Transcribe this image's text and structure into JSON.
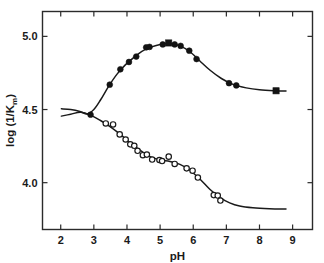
{
  "chart_data": {
    "type": "scatter",
    "title": "",
    "xlabel": "pH",
    "ylabel": "log (1/K",
    "ylabel_sub": "m",
    "ylabel_tail": ")",
    "xlim": [
      1.45,
      9.6
    ],
    "ylim": [
      3.68,
      5.17
    ],
    "xticks": [
      2,
      3,
      4,
      5,
      6,
      7,
      8,
      9
    ],
    "xticklabels": [
      "2",
      "3",
      "4",
      "5",
      "6",
      "7",
      "8",
      "9"
    ],
    "yticks": [
      4.0,
      4.5,
      5.0
    ],
    "yticklabels": [
      "4.0",
      "4.5",
      "5.0"
    ],
    "grid": false,
    "legend": "none",
    "frame": "box",
    "ticks_inside": true,
    "series": [
      {
        "name": "upper-branch-filled",
        "marker": "filled-circle",
        "points": [
          {
            "x": 2.9,
            "y": 4.465
          },
          {
            "x": 3.48,
            "y": 4.67
          },
          {
            "x": 3.8,
            "y": 4.775
          },
          {
            "x": 4.06,
            "y": 4.825
          },
          {
            "x": 4.28,
            "y": 4.862
          },
          {
            "x": 4.58,
            "y": 4.925
          },
          {
            "x": 4.68,
            "y": 4.928
          },
          {
            "x": 5.08,
            "y": 4.945
          },
          {
            "x": 5.44,
            "y": 4.945
          },
          {
            "x": 5.62,
            "y": 4.935
          },
          {
            "x": 5.88,
            "y": 4.902
          },
          {
            "x": 6.1,
            "y": 4.845
          },
          {
            "x": 7.08,
            "y": 4.68
          },
          {
            "x": 7.3,
            "y": 4.665
          }
        ]
      },
      {
        "name": "upper-branch-square",
        "marker": "filled-square",
        "points": [
          {
            "x": 5.26,
            "y": 4.955
          },
          {
            "x": 8.5,
            "y": 4.628
          }
        ]
      },
      {
        "name": "lower-branch-open",
        "marker": "open-circle",
        "points": [
          {
            "x": 3.36,
            "y": 4.405
          },
          {
            "x": 3.58,
            "y": 4.398
          },
          {
            "x": 3.78,
            "y": 4.33
          },
          {
            "x": 3.96,
            "y": 4.295
          },
          {
            "x": 4.1,
            "y": 4.262
          },
          {
            "x": 4.22,
            "y": 4.252
          },
          {
            "x": 4.32,
            "y": 4.218
          },
          {
            "x": 4.48,
            "y": 4.188
          },
          {
            "x": 4.6,
            "y": 4.192
          },
          {
            "x": 4.76,
            "y": 4.158
          },
          {
            "x": 4.98,
            "y": 4.155
          },
          {
            "x": 5.06,
            "y": 4.148
          },
          {
            "x": 5.26,
            "y": 4.178
          },
          {
            "x": 5.44,
            "y": 4.128
          },
          {
            "x": 5.8,
            "y": 4.098
          },
          {
            "x": 5.98,
            "y": 4.082
          },
          {
            "x": 6.14,
            "y": 4.035
          },
          {
            "x": 6.62,
            "y": 3.915
          },
          {
            "x": 6.74,
            "y": 3.912
          },
          {
            "x": 6.82,
            "y": 3.878
          }
        ]
      }
    ],
    "curves": [
      {
        "name": "upper-curve",
        "path": [
          {
            "x": 2.02,
            "y": 4.505
          },
          {
            "x": 2.3,
            "y": 4.5
          },
          {
            "x": 2.58,
            "y": 4.487
          },
          {
            "x": 2.8,
            "y": 4.47
          },
          {
            "x": 3.0,
            "y": 4.5
          },
          {
            "x": 3.2,
            "y": 4.565
          },
          {
            "x": 3.45,
            "y": 4.66
          },
          {
            "x": 3.7,
            "y": 4.742
          },
          {
            "x": 3.95,
            "y": 4.805
          },
          {
            "x": 4.2,
            "y": 4.855
          },
          {
            "x": 4.45,
            "y": 4.898
          },
          {
            "x": 4.7,
            "y": 4.925
          },
          {
            "x": 5.0,
            "y": 4.945
          },
          {
            "x": 5.3,
            "y": 4.952
          },
          {
            "x": 5.6,
            "y": 4.935
          },
          {
            "x": 5.9,
            "y": 4.895
          },
          {
            "x": 6.2,
            "y": 4.832
          },
          {
            "x": 6.5,
            "y": 4.77
          },
          {
            "x": 6.85,
            "y": 4.712
          },
          {
            "x": 7.2,
            "y": 4.672
          },
          {
            "x": 7.6,
            "y": 4.648
          },
          {
            "x": 8.0,
            "y": 4.635
          },
          {
            "x": 8.5,
            "y": 4.628
          },
          {
            "x": 8.8,
            "y": 4.626
          }
        ]
      },
      {
        "name": "lower-curve",
        "path": [
          {
            "x": 2.02,
            "y": 4.455
          },
          {
            "x": 2.3,
            "y": 4.468
          },
          {
            "x": 2.6,
            "y": 4.482
          },
          {
            "x": 2.9,
            "y": 4.462
          },
          {
            "x": 3.2,
            "y": 4.425
          },
          {
            "x": 3.5,
            "y": 4.382
          },
          {
            "x": 3.8,
            "y": 4.33
          },
          {
            "x": 4.1,
            "y": 4.272
          },
          {
            "x": 4.4,
            "y": 4.22
          },
          {
            "x": 4.7,
            "y": 4.178
          },
          {
            "x": 5.0,
            "y": 4.155
          },
          {
            "x": 5.3,
            "y": 4.145
          },
          {
            "x": 5.6,
            "y": 4.125
          },
          {
            "x": 5.9,
            "y": 4.085
          },
          {
            "x": 6.2,
            "y": 4.025
          },
          {
            "x": 6.5,
            "y": 3.955
          },
          {
            "x": 6.8,
            "y": 3.9
          },
          {
            "x": 7.1,
            "y": 3.862
          },
          {
            "x": 7.4,
            "y": 3.84
          },
          {
            "x": 7.8,
            "y": 3.828
          },
          {
            "x": 8.3,
            "y": 3.822
          },
          {
            "x": 8.8,
            "y": 3.82
          }
        ]
      }
    ]
  }
}
